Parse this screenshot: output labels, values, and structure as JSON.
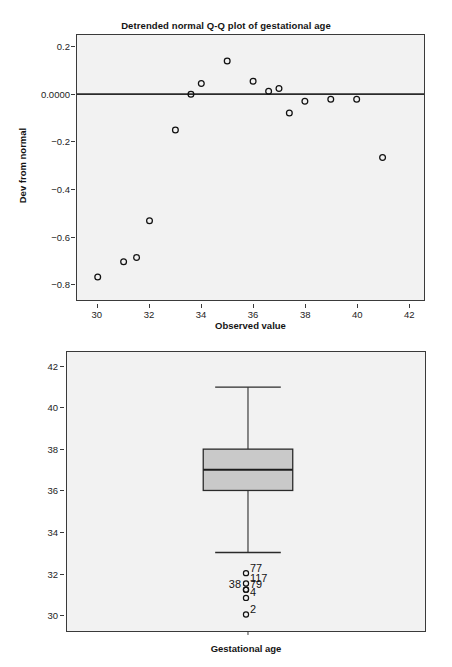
{
  "figures": [
    {
      "id": "qq",
      "title": "Detrended normal Q-Q plot of gestational age",
      "xlabel": "Observed value",
      "ylabel": "Dev from normal",
      "yticks": [
        "0.2",
        "0.0000",
        "-0.2",
        "-0.4",
        "-0.6",
        "-0.8"
      ],
      "xticks": [
        "30",
        "32",
        "34",
        "36",
        "38",
        "40",
        "42"
      ]
    },
    {
      "id": "box",
      "xlabel": "Gestational age",
      "yticks": [
        "42",
        "40",
        "38",
        "36",
        "34",
        "32",
        "30"
      ],
      "outlier_labels": [
        "77",
        "117",
        "38",
        "79",
        "4",
        "2"
      ]
    }
  ],
  "chart_data": [
    {
      "type": "scatter",
      "title": "Detrended normal Q-Q plot of gestational age",
      "xlabel": "Observed value",
      "ylabel": "Dev from normal",
      "xlim": [
        29.2,
        42.6
      ],
      "ylim": [
        -0.87,
        0.25
      ],
      "grid": false,
      "legend": null,
      "reference_line": {
        "type": "horizontal",
        "y": 0.0
      },
      "ytick_values": [
        0.2,
        0.0,
        -0.2,
        -0.4,
        -0.6,
        -0.8
      ],
      "xtick_values": [
        30,
        32,
        34,
        36,
        38,
        40,
        42
      ],
      "x": [
        30.0,
        31.0,
        31.5,
        32.0,
        33.0,
        33.6,
        34.0,
        35.0,
        36.0,
        36.6,
        37.0,
        37.4,
        38.0,
        39.0,
        40.0,
        41.0
      ],
      "y": [
        -0.773,
        -0.708,
        -0.69,
        -0.535,
        -0.152,
        0.0,
        0.045,
        0.14,
        0.055,
        0.012,
        0.024,
        -0.08,
        -0.03,
        -0.022,
        -0.022,
        -0.268
      ],
      "marker": "open-circle",
      "marker_color": "#111111"
    },
    {
      "type": "boxplot",
      "xlabel": "Gestational age",
      "ylabel": "",
      "ylim": [
        29.2,
        42.7
      ],
      "ytick_values": [
        42,
        40,
        38,
        36,
        34,
        32,
        30
      ],
      "categories": [
        "Gestational age"
      ],
      "boxes": [
        {
          "label": "Gestational age",
          "whisker_low": 33,
          "q1": 36,
          "median": 37,
          "q3": 38,
          "whisker_high": 41,
          "fill": "#c9c9c9",
          "outliers": [
            {
              "value": 32.0,
              "label": "77",
              "label_side": "right"
            },
            {
              "value": 31.5,
              "label": "117",
              "label_side": "right"
            },
            {
              "value": 31.2,
              "label": "38",
              "label_side": "left"
            },
            {
              "value": 31.2,
              "label": "79",
              "label_side": "right"
            },
            {
              "value": 30.8,
              "label": "4",
              "label_side": "right"
            },
            {
              "value": 30.0,
              "label": "2",
              "label_side": "right"
            }
          ]
        }
      ]
    }
  ],
  "colors": {
    "panel_background": "#f2f2f2",
    "frame": "#3a3a3a",
    "ink": "#141414",
    "box_fill": "#c9c9c9"
  }
}
